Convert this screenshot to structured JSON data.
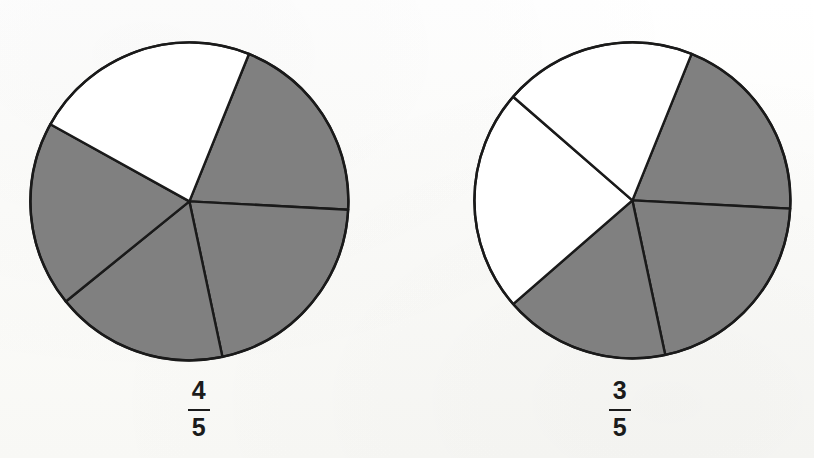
{
  "page": {
    "background_color": "#fdfdfb",
    "width": 814,
    "height": 458
  },
  "style": {
    "shaded_fill": "#808080",
    "unshaded_fill": "#ffffff",
    "outline_color": "#1a1a1a",
    "outline_width": 2.4,
    "label_color": "#1b1b1b"
  },
  "chart_data": [
    {
      "type": "pie",
      "id": "pie-left",
      "title": "",
      "label": "4/5",
      "numerator": "4",
      "denominator": "5",
      "total_sectors": 5,
      "shaded_sectors": 4,
      "unshaded_sectors": 1,
      "fraction_value": 0.8,
      "center_x": 189,
      "center_y": 201,
      "radius": 159,
      "categories": [
        "sector 1",
        "sector 2",
        "sector 3",
        "sector 4",
        "sector 5"
      ],
      "values": [
        72,
        72,
        72,
        72,
        72
      ],
      "sector_boundaries_deg": [
        -68,
        3,
        78,
        141,
        209
      ],
      "sectors": [
        {
          "name": "sector 1",
          "start_deg": -68,
          "end_deg": 3,
          "shaded": true
        },
        {
          "name": "sector 2",
          "start_deg": 3,
          "end_deg": 78,
          "shaded": true
        },
        {
          "name": "sector 3",
          "start_deg": 78,
          "end_deg": 141,
          "shaded": true
        },
        {
          "name": "sector 4",
          "start_deg": 141,
          "end_deg": 209,
          "shaded": true
        },
        {
          "name": "sector 5",
          "start_deg": 209,
          "end_deg": 292,
          "shaded": false
        }
      ],
      "legend": [],
      "grid": false
    },
    {
      "type": "pie",
      "id": "pie-right",
      "title": "",
      "label": "3/5",
      "numerator": "3",
      "denominator": "5",
      "total_sectors": 5,
      "shaded_sectors": 3,
      "unshaded_sectors": 2,
      "fraction_value": 0.6,
      "center_x": 632,
      "center_y": 200,
      "radius": 158,
      "categories": [
        "sector 1",
        "sector 2",
        "sector 3",
        "sector 4",
        "sector 5"
      ],
      "values": [
        72,
        72,
        72,
        72,
        72
      ],
      "sector_boundaries_deg": [
        -68,
        3,
        78,
        139,
        221
      ],
      "sectors": [
        {
          "name": "sector 1",
          "start_deg": -68,
          "end_deg": 3,
          "shaded": true
        },
        {
          "name": "sector 2",
          "start_deg": 3,
          "end_deg": 78,
          "shaded": true
        },
        {
          "name": "sector 3",
          "start_deg": 78,
          "end_deg": 139,
          "shaded": true
        },
        {
          "name": "sector 4",
          "start_deg": 139,
          "end_deg": 221,
          "shaded": false
        },
        {
          "name": "sector 5",
          "start_deg": 221,
          "end_deg": 292,
          "shaded": false
        }
      ],
      "legend": [],
      "grid": false
    }
  ],
  "labels": {
    "left": {
      "numerator": "4",
      "denominator": "5",
      "text": "4/5",
      "x": 199,
      "y": 378
    },
    "right": {
      "numerator": "3",
      "denominator": "5",
      "text": "3/5",
      "x": 620,
      "y": 378
    }
  }
}
